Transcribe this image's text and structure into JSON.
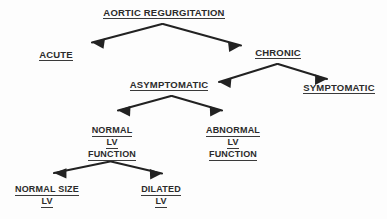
{
  "diagram": {
    "title": "AORTIC REGURGITATION",
    "type": "decision-tree-flowchart",
    "colors": {
      "background": "#fdfdfd",
      "text": "#2b2b2b",
      "line": "#3a3a3a",
      "arrow": "#222222"
    },
    "nodes": {
      "root": {
        "label": "AORTIC REGURGITATION",
        "lines": [
          "AORTIC REGURGITATION"
        ]
      },
      "acute": {
        "label": "ACUTE",
        "lines": [
          "ACUTE"
        ]
      },
      "chronic": {
        "label": "CHRONIC",
        "lines": [
          "CHRONIC"
        ]
      },
      "asymptomatic": {
        "label": "ASYMPTOMATIC",
        "lines": [
          "ASYMPTOMATIC"
        ]
      },
      "symptomatic": {
        "label": "SYMPTOMATIC",
        "lines": [
          "SYMPTOMATIC"
        ]
      },
      "normal_lv_function": {
        "label": "NORMAL LV FUNCTION",
        "lines": [
          "NORMAL",
          "LV",
          "FUNCTION"
        ]
      },
      "abnormal_lv_function": {
        "label": "ABNORMAL LV FUNCTION",
        "lines": [
          "ABNORMAL",
          "LV",
          "FUNCTION"
        ]
      },
      "normal_size_lv": {
        "label": "NORMAL SIZE LV",
        "lines": [
          "NORMAL SIZE",
          "LV"
        ]
      },
      "dilated_lv": {
        "label": "DILATED LV",
        "lines": [
          "DILATED",
          "LV"
        ]
      }
    },
    "edges": [
      {
        "from": "root",
        "to": "acute"
      },
      {
        "from": "root",
        "to": "chronic"
      },
      {
        "from": "chronic",
        "to": "asymptomatic"
      },
      {
        "from": "chronic",
        "to": "symptomatic"
      },
      {
        "from": "asymptomatic",
        "to": "normal_lv_function"
      },
      {
        "from": "asymptomatic",
        "to": "abnormal_lv_function"
      },
      {
        "from": "normal_lv_function",
        "to": "normal_size_lv"
      },
      {
        "from": "normal_lv_function",
        "to": "dilated_lv"
      }
    ]
  }
}
